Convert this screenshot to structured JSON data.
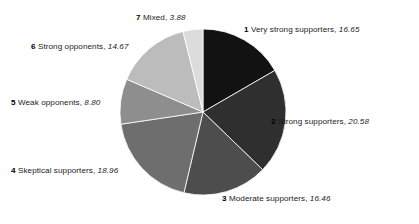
{
  "chart_data": {
    "type": "pie",
    "title": "",
    "subtitle": "",
    "xlabel": "",
    "ylabel": "",
    "legend_position": "around-slices",
    "grid": false,
    "start_angle_deg": 0,
    "direction": "clockwise",
    "total": 100.0,
    "categories": [
      "Very strong supporters",
      "Strong supporters",
      "Moderate supporters",
      "Skeptical supporters",
      "Weak opponents",
      "Strong opponents",
      "Mixed"
    ],
    "values": [
      16.65,
      20.58,
      16.46,
      18.96,
      8.8,
      14.67,
      3.88
    ],
    "slices": [
      {
        "index": "1",
        "label": "Very strong supporters",
        "value": "16.65",
        "value_num": 16.65,
        "color": "#121212"
      },
      {
        "index": "2",
        "label": "Strong supporters",
        "value": "20.58",
        "value_num": 20.58,
        "color": "#2f2f2f"
      },
      {
        "index": "3",
        "label": "Moderate supporters",
        "value": "16.46",
        "value_num": 16.46,
        "color": "#4d4d4d"
      },
      {
        "index": "4",
        "label": "Skeptical supporters",
        "value": "18.96",
        "value_num": 18.96,
        "color": "#6e6e6e"
      },
      {
        "index": "5",
        "label": "Weak opponents",
        "value": "8.80",
        "value_num": 8.8,
        "color": "#8e8e8e"
      },
      {
        "index": "6",
        "label": "Strong opponents",
        "value": "14.67",
        "value_num": 14.67,
        "color": "#bcbcbc"
      },
      {
        "index": "7",
        "label": "Mixed",
        "value": "3.88",
        "value_num": 3.88,
        "color": "#dcdcdc"
      }
    ],
    "separator": ", ",
    "geometry": {
      "center_x": 203,
      "center_y": 112,
      "radius": 83,
      "slice_border_color": "#ffffff",
      "slice_border_width": 0.8
    },
    "background_color": "#ffffff"
  }
}
